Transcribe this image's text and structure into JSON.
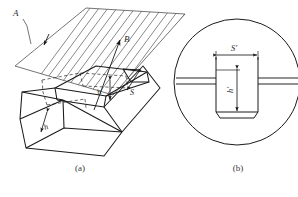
{
  "figure": {
    "background_color": "#ffffff",
    "line_color": "#1a1a1a",
    "hatch_color": "#4a4a4a",
    "dashed_color": "#2a2a2a",
    "width": 298,
    "height": 197
  },
  "captions": {
    "part_a": "(a)",
    "part_b": "(b)"
  },
  "panel_a": {
    "name": "isometric-view",
    "labels": {
      "plane_a": "A",
      "direction_b": "B",
      "step_height": "h",
      "step_width": "S",
      "groove_depth": "h"
    },
    "annotations": {
      "plane_a_leader": "leader line from label A to hatched cutting plane",
      "plane_a_arrow": "feed arrow inside hatched plane pointing down-left",
      "direction_b_arrow": "arrow pointing up-right labelled B"
    }
  },
  "panel_b": {
    "name": "circular-detail-view",
    "labels": {
      "groove_width": "S′",
      "groove_depth": "h′"
    },
    "annotations": {
      "enclosure": "circular detail boundary",
      "groove": "rectangular groove with chamfered bottom corners",
      "surface_lines": "two horizontal surface lines entering from left and right"
    }
  }
}
